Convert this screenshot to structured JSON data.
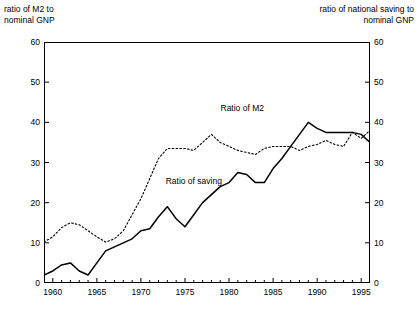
{
  "axis_captions": {
    "left": "ratio of M2 to\nnominal GNP",
    "right": "ratio of national saving to\nnominal GNP"
  },
  "series_labels": {
    "m2": "Ratio of M2",
    "saving": "Ratio of saving"
  },
  "colors": {
    "line": "#000000",
    "frame": "#000000",
    "background": "#ffffff"
  },
  "chart_data": {
    "type": "line",
    "title": "",
    "xlabel": "",
    "ylabel": "ratio of M2 to nominal GNP",
    "y2label": "ratio of national saving to nominal GNP",
    "xlim": [
      1959,
      1996
    ],
    "ylim": [
      0,
      60
    ],
    "y2lim": [
      0,
      60
    ],
    "grid": false,
    "legend": "inline-annotations",
    "yticks": [
      0,
      10,
      20,
      30,
      40,
      50,
      60
    ],
    "y2ticks": [
      0,
      10,
      20,
      30,
      40,
      50,
      60
    ],
    "xticks": [
      1960,
      1965,
      1970,
      1975,
      1980,
      1985,
      1990,
      1995
    ],
    "xminor_tick_interval": 1,
    "x": [
      1959,
      1960,
      1961,
      1962,
      1963,
      1964,
      1965,
      1966,
      1967,
      1968,
      1969,
      1970,
      1971,
      1972,
      1973,
      1974,
      1975,
      1976,
      1977,
      1978,
      1979,
      1980,
      1981,
      1982,
      1983,
      1984,
      1985,
      1986,
      1987,
      1988,
      1989,
      1990,
      1991,
      1992,
      1993,
      1994,
      1995,
      1996
    ],
    "series": [
      {
        "name": "Ratio of M2",
        "style": "dotted",
        "axis": "left",
        "values": [
          10.2,
          11.5,
          13.8,
          15.0,
          14.5,
          13.0,
          11.5,
          10.2,
          11.0,
          13.0,
          17.0,
          21.0,
          26.0,
          31.0,
          33.5,
          33.5,
          33.5,
          33.0,
          35.0,
          37.0,
          35.0,
          34.0,
          33.0,
          32.5,
          32.0,
          33.5,
          34.0,
          34.0,
          34.0,
          33.0,
          34.0,
          34.5,
          35.5,
          34.5,
          34.0,
          37.5,
          36.0,
          38.0
        ]
      },
      {
        "name": "Ratio of saving",
        "style": "solid",
        "axis": "right",
        "values": [
          2.0,
          3.0,
          4.5,
          5.0,
          3.0,
          2.0,
          5.0,
          8.0,
          9.0,
          10.0,
          11.0,
          13.0,
          13.5,
          16.5,
          19.0,
          16.0,
          14.0,
          17.0,
          20.0,
          22.0,
          24.0,
          25.0,
          27.5,
          27.0,
          25.0,
          25.0,
          28.5,
          31.0,
          34.0,
          37.0,
          40.0,
          38.5,
          37.5,
          37.5,
          37.5,
          37.5,
          37.0,
          35.0
        ]
      }
    ],
    "series_right_trace_note": "second series values read against right axis",
    "annotations": [
      {
        "text": "Ratio of M2",
        "x": 1981.5,
        "y": 43.5
      },
      {
        "text": "Ratio of saving",
        "x": 1976.0,
        "y": 25.5
      }
    ]
  }
}
